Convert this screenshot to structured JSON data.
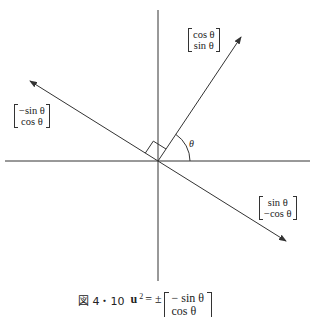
{
  "figure": {
    "vectors": {
      "u1": {
        "top": "cos θ",
        "bottom": "sin θ"
      },
      "u2_up": {
        "top": "−sin θ",
        "bottom": "cos θ"
      },
      "u2_down": {
        "top": "sin θ",
        "bottom": "−cos θ"
      }
    },
    "angle_label": "θ",
    "colors": {
      "line": "#333333",
      "background": "#ffffff"
    }
  },
  "caption": {
    "figure_label": "図 4・10",
    "lhs": "u",
    "subscript": "2",
    "equals": "= ±",
    "matrix_top": "− sin θ",
    "matrix_bottom": "cos θ"
  }
}
